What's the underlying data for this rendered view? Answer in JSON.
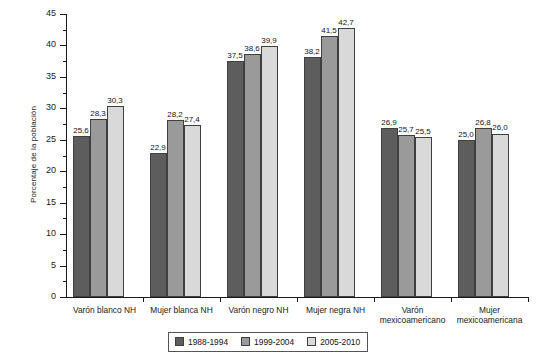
{
  "chart_data": {
    "type": "bar",
    "title": "",
    "xlabel": "",
    "ylabel": "Porcentaje de la población",
    "ylim": [
      0,
      45
    ],
    "ytick_step": 5,
    "yticks": [
      0,
      5,
      10,
      15,
      20,
      25,
      30,
      35,
      40,
      45
    ],
    "grid": false,
    "legend_position": "bottom-center",
    "categories": [
      "Varón blanco NH",
      "Mujer blanca NH",
      "Varón negro NH",
      "Mujer negra NH",
      "Varón mexicoamericano",
      "Mujer mexicoamericana"
    ],
    "category_lines": [
      [
        "Varón blanco NH"
      ],
      [
        "Mujer blanca NH"
      ],
      [
        "Varón negro NH"
      ],
      [
        "Mujer negra NH"
      ],
      [
        "Varón",
        "mexicoamericano"
      ],
      [
        "Mujer",
        "mexicoamericana"
      ]
    ],
    "series": [
      {
        "name": "1988-1994",
        "color": "#5d5d5d",
        "values": [
          25.6,
          22.9,
          37.5,
          38.2,
          26.9,
          25.0
        ],
        "labels": [
          "25,6",
          "22,9",
          "37,5",
          "38,2",
          "26,9",
          "25,0"
        ]
      },
      {
        "name": "1999-2004",
        "color": "#9a9a9a",
        "values": [
          28.3,
          28.2,
          38.6,
          41.5,
          25.7,
          26.8
        ],
        "labels": [
          "28,3",
          "28,2",
          "38,6",
          "41,5",
          "25,7",
          "26,8"
        ]
      },
      {
        "name": "2005-2010",
        "color": "#d9d9d9",
        "values": [
          30.3,
          27.4,
          39.9,
          42.7,
          25.5,
          26.0
        ],
        "labels": [
          "30,3",
          "27,4",
          "39,9",
          "42,7",
          "25,5",
          "26,0"
        ]
      }
    ]
  },
  "legend": {
    "items": [
      {
        "label": "1988-1994"
      },
      {
        "label": "1999-2004"
      },
      {
        "label": "2005-2010"
      }
    ]
  },
  "caption": ""
}
